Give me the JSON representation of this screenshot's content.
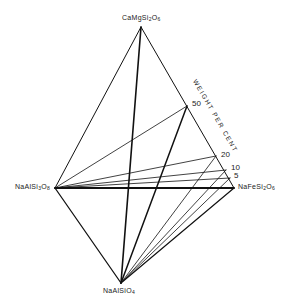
{
  "diagram": {
    "type": "tetrahedral phase diagram projection",
    "vertices": {
      "top": {
        "formula": "CaMgSi2O6",
        "label_parts": [
          "CaMgSi",
          "2",
          "O",
          "6"
        ],
        "x": 141,
        "y": 27
      },
      "left": {
        "formula": "NaAlSi3O8",
        "label_parts": [
          "NaAlSi",
          "3",
          "O",
          "8"
        ],
        "x": 55,
        "y": 188
      },
      "right": {
        "formula": "NaFeSi2O6",
        "label_parts": [
          "NaFeSi",
          "2",
          "O",
          "6"
        ],
        "x": 234,
        "y": 188
      },
      "bottom": {
        "formula": "NaAlSiO4",
        "label_parts": [
          "NaAlSiO",
          "4"
        ],
        "x": 121,
        "y": 283
      }
    },
    "axis_title": "WEIGHT PER CENT",
    "tick_points": [
      {
        "label": "50",
        "x": 187,
        "y": 106
      },
      {
        "label": "20",
        "x": 216,
        "y": 156
      },
      {
        "label": "10",
        "x": 226,
        "y": 170
      },
      {
        "label": "5",
        "x": 230,
        "y": 178
      }
    ],
    "stroke_color": "#111111",
    "background": "#ffffff"
  }
}
